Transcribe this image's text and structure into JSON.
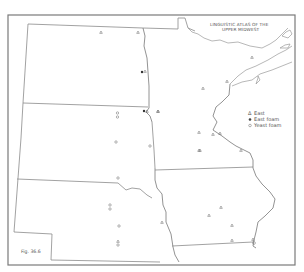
{
  "map": {
    "title_line1": "LINGUISTIC ATLAS OF THE",
    "title_line2": "UPPER MIDWEST",
    "figure_label": "Fig. 36.6",
    "legend": {
      "items": [
        {
          "symbol": "triangle-open",
          "glyph": "△",
          "label": "East"
        },
        {
          "symbol": "dot-filled",
          "glyph": "●",
          "label": "East foam"
        },
        {
          "symbol": "circle-open",
          "glyph": "○",
          "label": "Yeast foam"
        }
      ]
    },
    "symbols": {
      "east_glyph": "Δ",
      "east_foam_glyph": "●",
      "yeast_foam_glyph": "o"
    },
    "colors": {
      "frame": "#7a7a7a",
      "border": "#8a8a8a",
      "text": "#555555",
      "background": "#ffffff"
    }
  }
}
